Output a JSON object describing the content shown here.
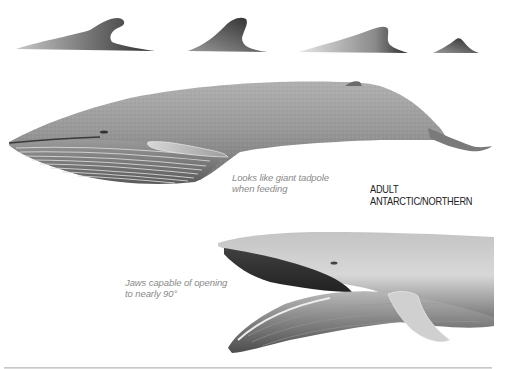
{
  "figure": {
    "dorsal_fins": [
      {
        "label": "dorsal-fin-variant-1"
      },
      {
        "label": "dorsal-fin-variant-2"
      },
      {
        "label": "dorsal-fin-variant-3"
      },
      {
        "label": "dorsal-fin-variant-4"
      }
    ],
    "adult_label": "ADULT ANTARCTIC/NORTHERN",
    "captions": {
      "tadpole_line1": "Looks like giant tadpole",
      "tadpole_line2": "when feeding",
      "jaws_line1": "Jaws capable of opening",
      "jaws_line2": "to nearly 90°"
    }
  },
  "colors": {
    "background": "#ffffff",
    "caption": "#8a8a8a",
    "label": "#222222",
    "body_gray": "#8c8c8c",
    "throat_pleat": "#d6d6d6"
  }
}
